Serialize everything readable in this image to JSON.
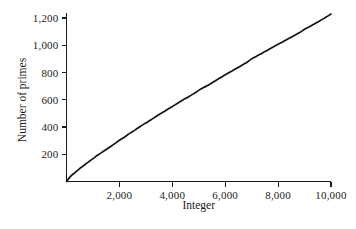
{
  "chart_data": {
    "type": "line",
    "title": "",
    "xlabel": "Integer",
    "ylabel": "Number of primes",
    "xlim": [
      0,
      10000
    ],
    "ylim": [
      0,
      1229
    ],
    "grid": false,
    "legend": null,
    "xticks": [
      2000,
      4000,
      6000,
      8000,
      10000
    ],
    "xtick_labels": [
      "2,000",
      "4,000",
      "6,000",
      "8,000",
      "10,000"
    ],
    "yticks": [
      200,
      400,
      600,
      800,
      1000,
      1200
    ],
    "ytick_labels": [
      "200",
      "400",
      "600",
      "800",
      "1,000",
      "1,200"
    ],
    "series": [
      {
        "name": "Number of primes below integer",
        "x": [
          0,
          100,
          200,
          300,
          400,
          500,
          600,
          700,
          800,
          900,
          1000,
          1200,
          1400,
          1600,
          1800,
          2000,
          2200,
          2400,
          2600,
          2800,
          3000,
          3200,
          3400,
          3600,
          3800,
          4000,
          4200,
          4400,
          4600,
          4800,
          5000,
          5200,
          5400,
          5600,
          5800,
          6000,
          6200,
          6400,
          6600,
          6800,
          7000,
          7200,
          7400,
          7600,
          7800,
          8000,
          8200,
          8400,
          8600,
          8800,
          9000,
          9200,
          9400,
          9600,
          9800,
          10000
        ],
        "y": [
          0,
          25,
          46,
          62,
          78,
          95,
          109,
          125,
          139,
          154,
          168,
          196,
          222,
          248,
          274,
          303,
          327,
          355,
          379,
          406,
          430,
          453,
          479,
          503,
          527,
          550,
          575,
          598,
          620,
          643,
          669,
          691,
          712,
          736,
          759,
          783,
          805,
          827,
          850,
          872,
          900,
          921,
          942,
          964,
          986,
          1007,
          1027,
          1049,
          1070,
          1091,
          1117,
          1138,
          1160,
          1181,
          1205,
          1229
        ]
      }
    ]
  },
  "figure": {
    "background_color": "#ffffff",
    "curve_color": "#141414",
    "axis_color": "#1c1c1c"
  }
}
